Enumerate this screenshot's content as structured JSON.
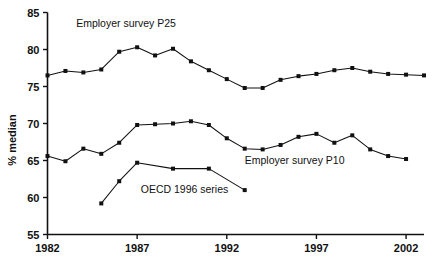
{
  "chart_data": {
    "type": "line",
    "title": "",
    "xlabel": "",
    "ylabel": "% median",
    "xlim": [
      1982,
      2003
    ],
    "ylim": [
      55,
      85
    ],
    "grid": false,
    "legend": "inline annotations",
    "xticks": [
      1982,
      1987,
      1992,
      1997,
      2002
    ],
    "yticks": [
      55,
      60,
      65,
      70,
      75,
      80,
      85
    ],
    "series": [
      {
        "name": "Employer survey P25",
        "annotation": "Employer survey P25",
        "x": [
          1982,
          1983,
          1984,
          1985,
          1986,
          1987,
          1988,
          1989,
          1990,
          1991,
          1992,
          1993,
          1994,
          1995,
          1996,
          1997,
          1998,
          1999,
          2000,
          2001,
          2002,
          2003
        ],
        "values": [
          76.5,
          77.1,
          76.9,
          77.3,
          79.7,
          80.3,
          79.2,
          80.1,
          78.4,
          77.2,
          76.0,
          74.8,
          74.8,
          75.9,
          76.4,
          76.7,
          77.2,
          77.5,
          77.0,
          76.7,
          76.6,
          76.5
        ]
      },
      {
        "name": "Employer survey P10",
        "annotation": "Employer survey P10",
        "x": [
          1982,
          1983,
          1984,
          1985,
          1986,
          1987,
          1988,
          1989,
          1990,
          1991,
          1992,
          1993,
          1994,
          1995,
          1996,
          1997,
          1998,
          1999,
          2000,
          2001,
          2002
        ],
        "values": [
          65.6,
          64.9,
          66.6,
          65.9,
          67.4,
          69.8,
          69.9,
          70.0,
          70.3,
          69.8,
          68.0,
          66.6,
          66.5,
          67.1,
          68.2,
          68.6,
          67.4,
          68.4,
          66.5,
          65.6,
          65.2
        ]
      },
      {
        "name": "OECD 1996 series",
        "annotation": "OECD 1996 series",
        "x": [
          1985,
          1986,
          1987,
          1989,
          1991,
          1993
        ],
        "values": [
          59.2,
          62.2,
          64.7,
          63.9,
          63.9,
          61.0
        ]
      }
    ],
    "annotations": [
      {
        "text": "Employer survey P25",
        "x": 1983.6,
        "y": 83.0
      },
      {
        "text": "Employer survey P10",
        "x": 1993.0,
        "y": 64.5
      },
      {
        "text": "OECD 1996 series",
        "x": 1987.2,
        "y": 60.6
      }
    ]
  },
  "axis": {
    "y_title": "% median",
    "y_tick_labels": [
      "85",
      "80",
      "75",
      "70",
      "65",
      "60",
      "55"
    ],
    "x_tick_labels": [
      "1982",
      "1987",
      "1992",
      "1997",
      "2002"
    ]
  }
}
